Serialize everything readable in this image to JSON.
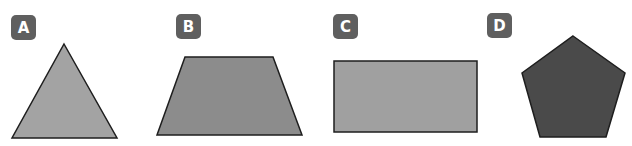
{
  "figures": [
    {
      "label": "A",
      "shape": "triangle",
      "fill": "#a3a3a3"
    },
    {
      "label": "B",
      "shape": "trapezoid",
      "fill": "#8c8c8c"
    },
    {
      "label": "C",
      "shape": "rectangle",
      "fill": "#a0a0a0"
    },
    {
      "label": "D",
      "shape": "pentagon",
      "fill": "#4a4a4a"
    }
  ],
  "colors": {
    "badge": "#5f5f5f",
    "badge_text": "#ffffff",
    "outline": "#1e1e1e"
  }
}
